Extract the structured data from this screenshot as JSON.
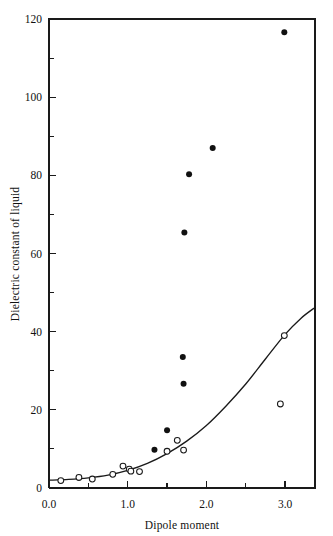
{
  "chart_data": {
    "type": "scatter",
    "title": "",
    "xlabel": "Dipole moment",
    "ylabel": "Dielectric constant of liquid",
    "xlim": [
      0.0,
      3.38
    ],
    "ylim": [
      0,
      120
    ],
    "grid": false,
    "legend": "none",
    "x_ticks_major": [
      "0.0",
      "1.0",
      "2.0",
      "3.0"
    ],
    "x_ticks_major_values": [
      0.0,
      1.0,
      2.0,
      3.0
    ],
    "x_ticks_minor_values": [
      0.5,
      1.5,
      2.5
    ],
    "y_ticks_major": [
      "0",
      "20",
      "40",
      "60",
      "80",
      "100",
      "120"
    ],
    "y_ticks_major_values": [
      0,
      20,
      40,
      60,
      80,
      100,
      120
    ],
    "y_ticks_minor_values": [
      10,
      30,
      50,
      70,
      90,
      110
    ],
    "series": [
      {
        "name": "filled-circles",
        "marker": "filled-circle",
        "points": [
          [
            1.34,
            9.8
          ],
          [
            1.5,
            14.8
          ],
          [
            1.71,
            26.7
          ],
          [
            1.7,
            33.5
          ],
          [
            1.72,
            65.4
          ],
          [
            1.78,
            80.3
          ],
          [
            2.08,
            87.0
          ],
          [
            2.99,
            116.6
          ]
        ]
      },
      {
        "name": "open-circles",
        "marker": "open-circle",
        "points": [
          [
            0.15,
            1.9
          ],
          [
            0.38,
            2.7
          ],
          [
            0.55,
            2.3
          ],
          [
            0.81,
            3.5
          ],
          [
            0.94,
            5.6
          ],
          [
            1.02,
            4.8
          ],
          [
            1.04,
            4.3
          ],
          [
            1.15,
            4.2
          ],
          [
            1.5,
            9.4
          ],
          [
            1.63,
            12.2
          ],
          [
            1.71,
            9.7
          ],
          [
            2.99,
            39.0
          ],
          [
            2.94,
            21.5
          ]
        ]
      }
    ],
    "fit_curve": {
      "name": "fitted-curve",
      "points": [
        [
          0.0,
          2.0
        ],
        [
          0.25,
          2.2
        ],
        [
          0.5,
          2.6
        ],
        [
          0.75,
          3.3
        ],
        [
          1.0,
          4.5
        ],
        [
          1.25,
          6.3
        ],
        [
          1.5,
          8.8
        ],
        [
          1.75,
          12.0
        ],
        [
          2.0,
          16.0
        ],
        [
          2.25,
          21.0
        ],
        [
          2.5,
          26.6
        ],
        [
          2.75,
          33.0
        ],
        [
          3.0,
          39.3
        ],
        [
          3.2,
          43.4
        ],
        [
          3.38,
          46.2
        ]
      ]
    }
  }
}
